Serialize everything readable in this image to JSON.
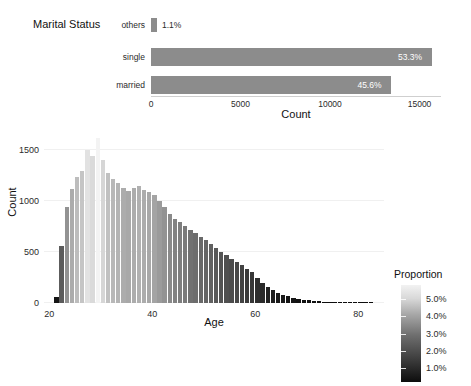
{
  "figure": {
    "background": "#ffffff",
    "bar_color": "#8c8c8c"
  },
  "bar_chart": {
    "title": "Marital Status",
    "xlabel": "Count",
    "xticks": [
      "0",
      "5000",
      "10000",
      "15000"
    ],
    "xtick_values": [
      0,
      5000,
      10000,
      15000
    ],
    "xlim": [
      0,
      16200
    ],
    "categories": [
      "others",
      "single",
      "married"
    ],
    "values": [
      330,
      15700,
      13430
    ],
    "labels": [
      "1.1%",
      "53.3%",
      "45.6%"
    ],
    "label_inside": [
      false,
      true,
      true
    ]
  },
  "histogram": {
    "xlabel": "Age",
    "ylabel": "Count",
    "xticks": [
      "20",
      "40",
      "60",
      "80"
    ],
    "xtick_values": [
      20,
      40,
      60,
      80
    ],
    "yticks": [
      "0",
      "500",
      "1000",
      "1500"
    ],
    "ytick_values": [
      0,
      500,
      1000,
      1500
    ],
    "xlim": [
      19,
      85
    ],
    "ylim": [
      0,
      1650
    ]
  },
  "legend": {
    "title": "Proportion",
    "labels": [
      "5.0%",
      "4.0%",
      "3.0%",
      "2.0%",
      "1.0%"
    ],
    "values": [
      5.0,
      4.0,
      3.0,
      2.0,
      1.0
    ],
    "gradient_low": "#0d0d0d",
    "gradient_high": "#f2f2f2"
  },
  "chart_data": [
    {
      "type": "bar",
      "orientation": "horizontal",
      "title": "Marital Status",
      "xlabel": "Count",
      "ylabel": "",
      "categories": [
        "others",
        "single",
        "married"
      ],
      "values": [
        330,
        15700,
        13430
      ],
      "data_labels": [
        "1.1%",
        "53.3%",
        "45.6%"
      ],
      "proportions": [
        1.1,
        53.3,
        45.6
      ],
      "xlim": [
        0,
        16200
      ],
      "xticks": [
        0,
        5000,
        10000,
        15000
      ],
      "grid": false,
      "legend": "none",
      "color": "#8c8c8c"
    },
    {
      "type": "bar",
      "subtype": "histogram",
      "title": "",
      "xlabel": "Age",
      "ylabel": "Count",
      "xlim": [
        19,
        85
      ],
      "ylim": [
        0,
        1650
      ],
      "xticks": [
        20,
        40,
        60,
        80
      ],
      "yticks": [
        0,
        500,
        1000,
        1500
      ],
      "grid": true,
      "colormap": "grayscale",
      "colorbar": {
        "title": "Proportion",
        "ticks": [
          1.0,
          2.0,
          3.0,
          4.0,
          5.0
        ],
        "ticklabels": [
          "1.0%",
          "2.0%",
          "3.0%",
          "4.0%",
          "5.0%"
        ],
        "position": "right"
      },
      "x": [
        21,
        22,
        23,
        24,
        25,
        26,
        27,
        28,
        29,
        30,
        31,
        32,
        33,
        34,
        35,
        36,
        37,
        38,
        39,
        40,
        41,
        42,
        43,
        44,
        45,
        46,
        47,
        48,
        49,
        50,
        51,
        52,
        53,
        54,
        55,
        56,
        57,
        58,
        59,
        60,
        61,
        62,
        63,
        64,
        65,
        66,
        67,
        68,
        69,
        70,
        71,
        72,
        73,
        74,
        75,
        76,
        77,
        78,
        79,
        80,
        81,
        82
      ],
      "values": [
        60,
        560,
        940,
        1120,
        1240,
        1300,
        1500,
        1440,
        1620,
        1400,
        1280,
        1220,
        1180,
        1130,
        1100,
        1130,
        1150,
        1110,
        1090,
        1060,
        1000,
        940,
        870,
        830,
        800,
        760,
        720,
        690,
        650,
        620,
        580,
        540,
        500,
        470,
        430,
        400,
        370,
        330,
        300,
        250,
        200,
        160,
        130,
        100,
        80,
        65,
        50,
        42,
        34,
        26,
        20,
        16,
        13,
        10,
        8,
        6,
        5,
        4,
        3,
        2,
        2,
        1
      ],
      "proportions_pct": [
        0.2,
        1.9,
        3.2,
        3.8,
        4.2,
        4.4,
        5.1,
        4.9,
        5.5,
        4.8,
        4.3,
        4.1,
        4.0,
        3.8,
        3.7,
        3.8,
        3.9,
        3.8,
        3.7,
        3.6,
        3.4,
        3.2,
        3.0,
        2.8,
        2.7,
        2.6,
        2.4,
        2.3,
        2.2,
        2.1,
        2.0,
        1.8,
        1.7,
        1.6,
        1.5,
        1.4,
        1.3,
        1.1,
        1.0,
        0.8,
        0.7,
        0.5,
        0.4,
        0.3,
        0.3,
        0.2,
        0.2,
        0.1,
        0.1,
        0.1,
        0.1,
        0.1,
        0.0,
        0.0,
        0.0,
        0.0,
        0.0,
        0.0,
        0.0,
        0.0,
        0.0,
        0.0
      ]
    }
  ]
}
